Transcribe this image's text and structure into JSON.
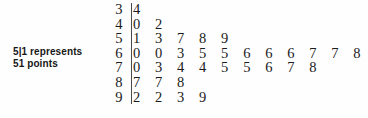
{
  "key": {
    "line1": "5|1 represents",
    "line2": "51 points"
  },
  "chart_data": {
    "type": "table",
    "plot_type": "stem-and-leaf",
    "title": "",
    "xlabel": "",
    "ylabel": "",
    "legend": "5|1 represents 51 points",
    "key_stem": "5",
    "key_leaf": "1",
    "key_value": 51,
    "stem_unit": "tens",
    "leaf_unit": "ones",
    "total_count": 35,
    "rows": [
      {
        "stem": "3",
        "leaves": [
          "4"
        ]
      },
      {
        "stem": "4",
        "leaves": [
          "0",
          "2"
        ]
      },
      {
        "stem": "5",
        "leaves": [
          "1",
          "3",
          "7",
          "8",
          "9"
        ]
      },
      {
        "stem": "6",
        "leaves": [
          "0",
          "0",
          "3",
          "5",
          "5",
          "6",
          "6",
          "6",
          "7",
          "7",
          "8"
        ]
      },
      {
        "stem": "7",
        "leaves": [
          "0",
          "3",
          "4",
          "4",
          "5",
          "5",
          "6",
          "7",
          "8"
        ]
      },
      {
        "stem": "8",
        "leaves": [
          "7",
          "7",
          "8"
        ]
      },
      {
        "stem": "9",
        "leaves": [
          "2",
          "2",
          "3",
          "9"
        ]
      }
    ],
    "values": [
      34,
      40,
      42,
      51,
      53,
      57,
      58,
      59,
      60,
      60,
      63,
      65,
      65,
      66,
      66,
      66,
      67,
      67,
      68,
      70,
      73,
      74,
      74,
      75,
      75,
      76,
      77,
      78,
      87,
      87,
      88,
      92,
      92,
      93,
      99
    ],
    "counts_per_stem": [
      1,
      2,
      5,
      11,
      9,
      3,
      4
    ],
    "max_leaves_in_row": 11,
    "grid": false
  }
}
